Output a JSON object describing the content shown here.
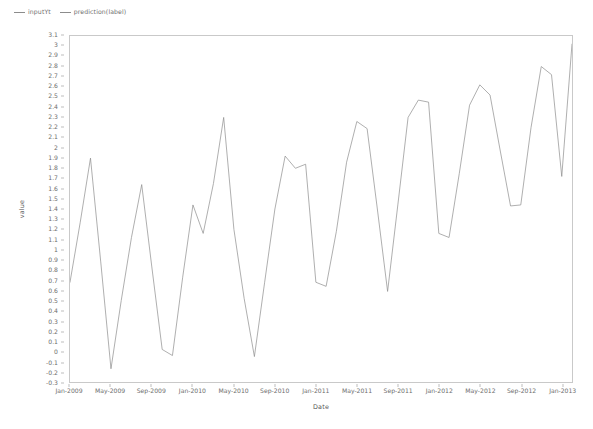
{
  "legend": {
    "position": "top-left",
    "entries": [
      {
        "label": "inputYt",
        "color": "#8c8c8c"
      },
      {
        "label": "prediction(label)",
        "color": "#8c8c8c"
      }
    ]
  },
  "axes": {
    "x_title": "Date",
    "y_title": "value"
  },
  "chart_data": {
    "type": "line",
    "title": "",
    "subtitle": "",
    "xlabel": "Date",
    "ylabel": "value",
    "grid": false,
    "legend_position": "top-left",
    "line_color": "#8c8c8c",
    "line_width": 0.7,
    "ylim": [
      -0.3,
      3.1
    ],
    "xlim": [
      "Jan-2009",
      "Feb-2013"
    ],
    "y_ticks": [
      -0.3,
      -0.2,
      -0.1,
      0,
      0.1,
      0.2,
      0.3,
      0.4,
      0.5,
      0.6,
      0.7,
      0.8,
      0.9,
      1,
      1.1,
      1.2,
      1.3,
      1.4,
      1.5,
      1.6,
      1.7,
      1.8,
      1.9,
      2,
      2.1,
      2.2,
      2.3,
      2.4,
      2.5,
      2.6,
      2.7,
      2.8,
      2.9,
      3,
      3.1
    ],
    "y_tick_labels": [
      "-0.3",
      "-0.2",
      "-0.1",
      "0",
      "0.1",
      "0.2",
      "0.3",
      "0.4",
      "0.5",
      "0.6",
      "0.7",
      "0.8",
      "0.9",
      "1",
      "1.1",
      "1.2",
      "1.3",
      "1.4",
      "1.5",
      "1.6",
      "1.7",
      "1.8",
      "1.9",
      "2",
      "2.1",
      "2.2",
      "2.3",
      "2.4",
      "2.5",
      "2.6",
      "2.7",
      "2.8",
      "2.9",
      "3",
      "3.1"
    ],
    "x_tick_labels": [
      "Jan-2009",
      "May-2009",
      "Sep-2009",
      "Jan-2010",
      "May-2010",
      "Sep-2010",
      "Jan-2011",
      "May-2011",
      "Sep-2011",
      "Jan-2012",
      "May-2012",
      "Sep-2012",
      "Jan-2013"
    ],
    "x_tick_indices": [
      0,
      4,
      8,
      12,
      16,
      20,
      24,
      28,
      32,
      36,
      40,
      44,
      48
    ],
    "x": [
      "Jan-2009",
      "Feb-2009",
      "Mar-2009",
      "Apr-2009",
      "May-2009",
      "Jun-2009",
      "Jul-2009",
      "Aug-2009",
      "Sep-2009",
      "Oct-2009",
      "Nov-2009",
      "Dec-2009",
      "Jan-2010",
      "Feb-2010",
      "Mar-2010",
      "Apr-2010",
      "May-2010",
      "Jun-2010",
      "Jul-2010",
      "Aug-2010",
      "Sep-2010",
      "Oct-2010",
      "Nov-2010",
      "Dec-2010",
      "Jan-2011",
      "Feb-2011",
      "Mar-2011",
      "Apr-2011",
      "May-2011",
      "Jun-2011",
      "Jul-2011",
      "Aug-2011",
      "Sep-2011",
      "Oct-2011",
      "Nov-2011",
      "Dec-2011",
      "Jan-2012",
      "Feb-2012",
      "Mar-2012",
      "Apr-2012",
      "May-2012",
      "Jun-2012",
      "Jul-2012",
      "Aug-2012",
      "Sep-2012",
      "Oct-2012",
      "Nov-2012",
      "Dec-2012",
      "Jan-2013",
      "Feb-2013"
    ],
    "series": [
      {
        "name": "inputYt",
        "values": [
          0.68,
          1.27,
          1.9,
          0.88,
          -0.17,
          0.5,
          1.12,
          1.64,
          0.82,
          0.02,
          -0.04,
          0.73,
          1.44,
          1.16,
          1.65,
          2.3,
          1.2,
          0.52,
          -0.05,
          0.68,
          1.4,
          1.92,
          1.8,
          1.84,
          0.68,
          0.64,
          1.18,
          1.86,
          2.26,
          2.19,
          1.4,
          0.59,
          1.44,
          2.3,
          2.47,
          2.45,
          1.16,
          1.12,
          1.75,
          2.42,
          2.62,
          2.52,
          1.97,
          1.43,
          1.44,
          2.2,
          2.8,
          2.72,
          1.72,
          3.02
        ]
      }
    ]
  }
}
